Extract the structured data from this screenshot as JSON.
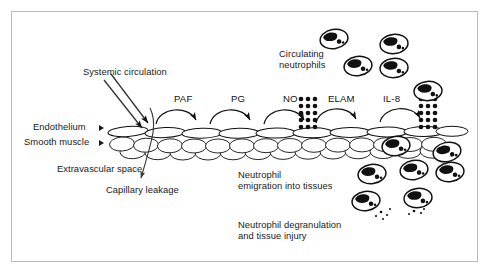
{
  "figure": {
    "frame_color": "#b9b9b9",
    "background": "#ffffff",
    "ink_color": "#111111"
  },
  "labels": {
    "systemic_circulation": "Systemic circulation",
    "endothelium": "Endothelium",
    "smooth_muscle": "Smooth muscle",
    "extravascular_space": "Extravascular space",
    "capillary_leakage": "Capillary leakage",
    "circulating_neutrophils_line1": "Circulating",
    "circulating_neutrophils_line2": "neutrophils",
    "neutrophil_emigration_line1": "Neutrophil",
    "neutrophil_emigration_line2": "emigration into tissues",
    "neutrophil_degranulation_line1": "Neutrophil degranulation",
    "neutrophil_degranulation_line2": "and tissue injury"
  },
  "mediators": [
    {
      "name": "PAF",
      "x": 175,
      "y": 95
    },
    {
      "name": "PG",
      "x": 228,
      "y": 95
    },
    {
      "name": "PG_full",
      "x": 0,
      "y": 0
    },
    {
      "name": "NO",
      "x": 284,
      "y": 95
    },
    {
      "name": "ELAM",
      "x": 330,
      "y": 95
    },
    {
      "name": "IL-8",
      "x": 392,
      "y": 95
    }
  ],
  "mediator_labels": [
    "PAF",
    "PG",
    "NO",
    "ELAM",
    "IL-8"
  ],
  "vessel": {
    "endothelium_cells": 12,
    "smooth_muscle_rows": 2,
    "smooth_muscle_cells_per_row": 13
  },
  "adhesion_molecule_clusters": [
    {
      "name": "elam-dot-cluster",
      "columns": 3,
      "rows": 5
    },
    {
      "name": "il8-dot-cluster",
      "columns": 3,
      "rows": 5
    }
  ],
  "neutrophils": {
    "circulating_count": 5,
    "rolling_adherent_count": 1,
    "emigrating_count": 4,
    "degranulating_count": 2
  },
  "arrows": {
    "systemic_circulation_arrows": 2,
    "mediator_arcs": 5,
    "capillary_leakage_arrow": 1
  },
  "icons": {
    "endothelium_pointer": "triangle-right-icon",
    "smooth_muscle_pointer": "triangle-right-icon"
  }
}
